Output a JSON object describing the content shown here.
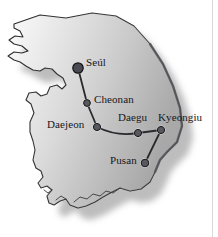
{
  "figure": {
    "region": "South Korea",
    "background_color": "#ffffff",
    "land_fill_light": "#f4f4f4",
    "land_fill_dark": "#d2d2d2",
    "coast_stroke": "#2b2b2b",
    "shadow_color": "#bdbdbd",
    "route_color": "#2a2a2e",
    "marker_fill": "#58585f",
    "marker_stroke": "#141417",
    "label_color": "#17171a"
  },
  "cities": [
    {
      "name": "Seúl",
      "x": 78,
      "y": 68,
      "marker_radius": 5.2,
      "major": true,
      "label_dx": 8,
      "label_dy": -11
    },
    {
      "name": "Cheonan",
      "x": 87,
      "y": 103,
      "marker_radius": 3.4,
      "major": false,
      "label_dx": 7,
      "label_dy": -9
    },
    {
      "name": "Daejeon",
      "x": 97,
      "y": 127,
      "marker_radius": 3.6,
      "major": false,
      "label_dx": -50,
      "label_dy": -8
    },
    {
      "name": "Daegu",
      "x": 138,
      "y": 133,
      "marker_radius": 3.6,
      "major": false,
      "label_dx": -20,
      "label_dy": -21
    },
    {
      "name": "Kyeongiu",
      "x": 161,
      "y": 130,
      "marker_radius": 3.6,
      "major": false,
      "label_dx": -3,
      "label_dy": -18
    },
    {
      "name": "Pusan",
      "x": 145,
      "y": 163,
      "marker_radius": 3.8,
      "major": false,
      "label_dx": -35,
      "label_dy": -8
    }
  ],
  "route": {
    "name": "rail-route",
    "order": [
      "Seúl",
      "Cheonan",
      "Daejeon",
      "Daegu",
      "Kyeongiu",
      "Pusan"
    ],
    "stroke_width": 1.8
  }
}
